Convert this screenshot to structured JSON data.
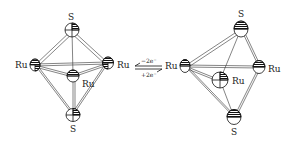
{
  "diagram": {
    "type": "molecular-structure-redox",
    "left_structure": {
      "name": "Ru3S2 cluster (oxidized form)",
      "atoms": [
        {
          "id": "S1",
          "label": "S",
          "x": 72,
          "y": 30
        },
        {
          "id": "Ru1",
          "label": "Ru",
          "x": 35,
          "y": 65
        },
        {
          "id": "Ru2",
          "label": "Ru",
          "x": 108,
          "y": 63
        },
        {
          "id": "Ru3",
          "label": "Ru",
          "x": 73,
          "y": 75
        },
        {
          "id": "S2",
          "label": "S",
          "x": 73,
          "y": 115
        }
      ]
    },
    "right_structure": {
      "name": "Ru3S2 cluster (reduced form)",
      "atoms": [
        {
          "id": "S1",
          "label": "S",
          "x": 241,
          "y": 29
        },
        {
          "id": "Ru1",
          "label": "Ru",
          "x": 185,
          "y": 66
        },
        {
          "id": "Ru2",
          "label": "Ru",
          "x": 259,
          "y": 67
        },
        {
          "id": "Ru3",
          "label": "Ru",
          "x": 220,
          "y": 80
        },
        {
          "id": "S2",
          "label": "S",
          "x": 234,
          "y": 117
        }
      ]
    },
    "equilibrium": {
      "top": "−2e⁻",
      "bottom": "+2e⁻"
    },
    "labels": {
      "S": "S",
      "Ru": "Ru"
    }
  }
}
